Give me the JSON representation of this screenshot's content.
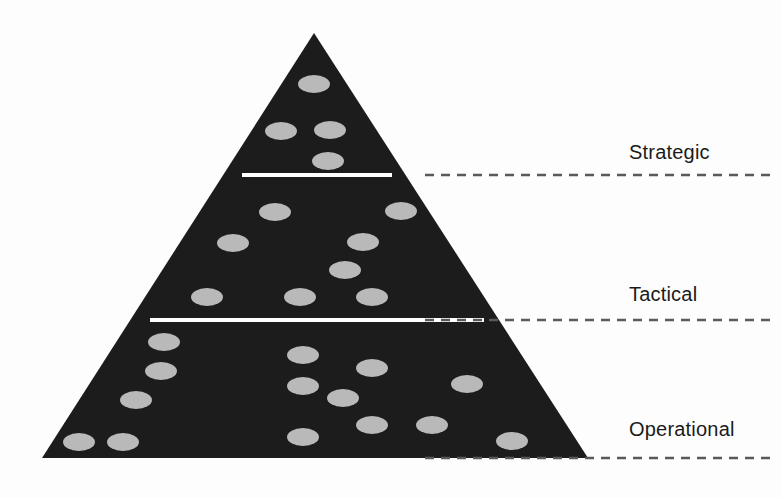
{
  "figure": {
    "kind": "pyramid-diagram",
    "background_color": "#fdfdfd",
    "pyramid_fill": "#1c1c1c",
    "divider_color": "#ffffff",
    "dot_color": "#b9b9b9",
    "leader_color": "#5a5a5a",
    "label_color": "#1b1b1b"
  },
  "pyramid": {
    "apex": {
      "x": 314,
      "y": 33
    },
    "base_left": {
      "x": 42,
      "y": 458
    },
    "base_right": {
      "x": 588,
      "y": 458
    },
    "dividers": [
      {
        "name": "strategic-tactical-divider",
        "y": 175,
        "x1": 242,
        "x2": 392
      },
      {
        "name": "tactical-operational-divider",
        "y": 320,
        "x1": 150,
        "x2": 484
      }
    ]
  },
  "tiers": [
    {
      "id": "strategic",
      "label": "Strategic",
      "label_x": 629,
      "label_y": 141,
      "leader": {
        "x1": 425,
        "x2": 772,
        "y": 175
      },
      "dot_count": 4,
      "dots": [
        {
          "cx": 314,
          "cy": 84
        },
        {
          "cx": 281,
          "cy": 131
        },
        {
          "cx": 330,
          "cy": 130
        },
        {
          "cx": 328,
          "cy": 161
        }
      ]
    },
    {
      "id": "tactical",
      "label": "Tactical",
      "label_x": 629,
      "label_y": 283,
      "leader": {
        "x1": 425,
        "x2": 772,
        "y": 320
      },
      "dot_count": 8,
      "dots": [
        {
          "cx": 275,
          "cy": 212
        },
        {
          "cx": 401,
          "cy": 211
        },
        {
          "cx": 233,
          "cy": 243
        },
        {
          "cx": 363,
          "cy": 242
        },
        {
          "cx": 345,
          "cy": 270
        },
        {
          "cx": 207,
          "cy": 297
        },
        {
          "cx": 300,
          "cy": 297
        },
        {
          "cx": 372,
          "cy": 297
        }
      ]
    },
    {
      "id": "operational",
      "label": "Operational",
      "label_x": 629,
      "label_y": 418,
      "leader": {
        "x1": 425,
        "x2": 772,
        "y": 458
      },
      "dot_count": 16,
      "dots": [
        {
          "cx": 164,
          "cy": 342
        },
        {
          "cx": 303,
          "cy": 355
        },
        {
          "cx": 161,
          "cy": 371
        },
        {
          "cx": 372,
          "cy": 368
        },
        {
          "cx": 303,
          "cy": 386
        },
        {
          "cx": 467,
          "cy": 384
        },
        {
          "cx": 136,
          "cy": 400
        },
        {
          "cx": 343,
          "cy": 398
        },
        {
          "cx": 372,
          "cy": 425
        },
        {
          "cx": 432,
          "cy": 425
        },
        {
          "cx": 79,
          "cy": 442
        },
        {
          "cx": 123,
          "cy": 442
        },
        {
          "cx": 303,
          "cy": 437
        },
        {
          "cx": 512,
          "cy": 441
        }
      ]
    }
  ],
  "dot_style": {
    "rx": 16,
    "ry": 9
  }
}
